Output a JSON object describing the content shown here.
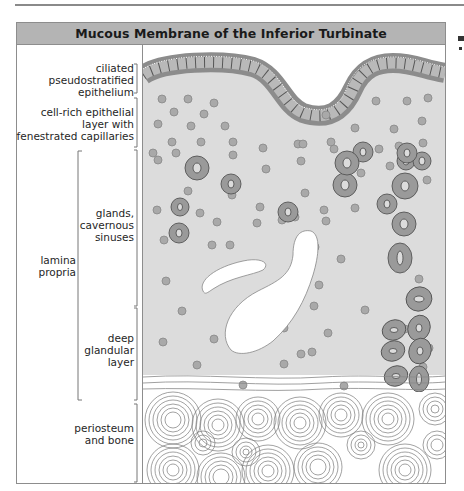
{
  "figure": {
    "title": "Mucous Membrane of the Inferior Turbinate",
    "colors": {
      "title_bar": "#b4b4b4",
      "tissue_fill": "#dcdcdc",
      "epithelium_band": "#8c8c8c",
      "cell_fill": "#a9a9a9",
      "gland_fill": "#9a9a9a",
      "sinus_fill": "#ffffff",
      "bone_line": "#7a7a7a"
    }
  },
  "labels": {
    "epithelium": "ciliated\npseudostratified\nepithelium",
    "cell_rich_layer": "cell-rich epithelial\nlayer with\nfenestrated capillaries",
    "glands_sinuses": "glands,\ncavernous\nsinuses",
    "lamina_propria": "lamina\npropria",
    "deep_glandular": "deep\nglandular\nlayer",
    "periosteum_bone": "periosteum\nand bone"
  }
}
